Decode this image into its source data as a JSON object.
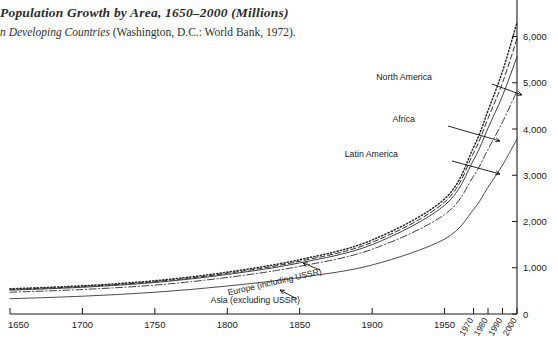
{
  "figure": {
    "title": "Population Growth by Area, 1650–2000 (Millions)",
    "caption_italic": "n Developing Countries",
    "caption_rest": " (Washington, D.C.: World Bank, 1972)."
  },
  "axes": {
    "y_title": "",
    "y_ticks": [
      "0",
      "1,000",
      "2,000",
      "3,000",
      "4,000",
      "5,000",
      "6,000"
    ],
    "y_tick_values": [
      0,
      1000,
      2000,
      3000,
      4000,
      5000,
      6000
    ],
    "x_ticks_major": [
      "1650",
      "1700",
      "1750",
      "1800",
      "1850",
      "1900",
      "1950"
    ],
    "x_tick_major_values": [
      1650,
      1700,
      1750,
      1800,
      1850,
      1900,
      1950
    ],
    "x_ticks_rotated": [
      "1970",
      "1980",
      "1990",
      "2000"
    ],
    "x_tick_rotated_values": [
      1970,
      1980,
      1990,
      2000
    ]
  },
  "annotations": [
    {
      "name": "north-america",
      "label": "North America",
      "x": 432,
      "y": 80,
      "lx1": 492,
      "ly1": 84,
      "lx2": 522,
      "ly2": 95
    },
    {
      "name": "africa",
      "label": "Africa",
      "x": 415,
      "y": 122,
      "lx1": 448,
      "ly1": 126,
      "lx2": 500,
      "ly2": 141
    },
    {
      "name": "latin-america",
      "label": "Latin America",
      "x": 398,
      "y": 157,
      "lx1": 452,
      "ly1": 161,
      "lx2": 500,
      "ly2": 174
    },
    {
      "name": "europe",
      "label": "Europe (including USSR)",
      "x": 322,
      "y": 274,
      "rot": -13,
      "lx1": 320,
      "ly1": 270,
      "lx2": 303,
      "ly2": 263
    },
    {
      "name": "asia",
      "label": "Asia (excluding USSR)",
      "x": 300,
      "y": 303,
      "rot": 0,
      "lx1": 297,
      "ly1": 299,
      "lx2": 280,
      "ly2": 290
    }
  ],
  "chart_data": {
    "type": "line",
    "title": "Population Growth by Area, 1650–2000 (Millions)",
    "xlabel": "",
    "ylabel": "Millions",
    "xlim": [
      1650,
      2000
    ],
    "ylim": [
      0,
      6400
    ],
    "grid": false,
    "legend": "annotated-on-curves",
    "x": [
      1650,
      1700,
      1750,
      1800,
      1850,
      1900,
      1950,
      1970,
      1980,
      1990,
      2000
    ],
    "series": [
      {
        "name": "World total (upper dotted)",
        "label": "North America",
        "style": "dotted",
        "values": [
          545,
          610,
          720,
          905,
          1175,
          1600,
          2490,
          3600,
          4400,
          5250,
          6300
        ]
      },
      {
        "name": "Africa",
        "label": "Africa",
        "style": "dashed",
        "values": [
          530,
          595,
          700,
          880,
          1140,
          1550,
          2420,
          3480,
          4230,
          5000,
          5950
        ]
      },
      {
        "name": "Latin America",
        "label": "Latin America",
        "style": "solid",
        "values": [
          515,
          578,
          682,
          855,
          1105,
          1500,
          2350,
          3330,
          4020,
          4720,
          5560
        ]
      },
      {
        "name": "Europe (including USSR)",
        "label": "Europe (including USSR)",
        "style": "dashdot",
        "values": [
          470,
          530,
          625,
          790,
          1030,
          1400,
          2150,
          2980,
          3560,
          4150,
          4820
        ]
      },
      {
        "name": "Asia (excluding USSR)",
        "label": "Asia (excluding USSR)",
        "style": "solid-thin",
        "values": [
          330,
          385,
          470,
          605,
          790,
          1060,
          1620,
          2260,
          2740,
          3220,
          3780
        ]
      }
    ]
  }
}
